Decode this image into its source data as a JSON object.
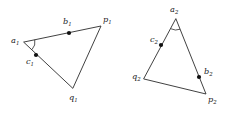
{
  "figure": {
    "type": "geometry-diagram",
    "background_color": "#ffffff",
    "stroke_color": "#2b2b2b",
    "dot_color": "#111111",
    "label_color": "#1a1a1a",
    "width": 230,
    "height": 114
  },
  "shapes": [
    {
      "id": "triangle-1",
      "name": "left-triangle",
      "vertices": [
        {
          "key": "a1",
          "base": "a",
          "sub": "1",
          "x": 24,
          "y": 42,
          "label_x": 11,
          "label_y": 43
        },
        {
          "key": "p1",
          "base": "p",
          "sub": "1",
          "x": 101,
          "y": 26,
          "label_x": 103,
          "label_y": 22
        },
        {
          "key": "q1",
          "base": "q",
          "sub": "1",
          "x": 73,
          "y": 88,
          "label_x": 69,
          "label_y": 100
        }
      ],
      "marked_points": [
        {
          "key": "b1",
          "base": "b",
          "sub": "1",
          "x": 69,
          "y": 33,
          "label_x": 63,
          "label_y": 24
        },
        {
          "key": "c1",
          "base": "c",
          "sub": "1",
          "x": 36,
          "y": 55,
          "label_x": 26,
          "label_y": 64
        }
      ],
      "angle_arc": {
        "at": "a1",
        "radius": 11
      }
    },
    {
      "id": "triangle-2",
      "name": "right-triangle",
      "vertices": [
        {
          "key": "a2",
          "base": "a",
          "sub": "2",
          "x": 176,
          "y": 19,
          "label_x": 170,
          "label_y": 12
        },
        {
          "key": "p2",
          "base": "p",
          "sub": "2",
          "x": 206,
          "y": 94,
          "label_x": 208,
          "label_y": 102
        },
        {
          "key": "q2",
          "base": "q",
          "sub": "2",
          "x": 144,
          "y": 79,
          "label_x": 132,
          "label_y": 79
        }
      ],
      "marked_points": [
        {
          "key": "c2",
          "base": "c",
          "sub": "2",
          "x": 161,
          "y": 45,
          "label_x": 150,
          "label_y": 42
        },
        {
          "key": "b2",
          "base": "b",
          "sub": "2",
          "x": 199,
          "y": 77,
          "label_x": 204,
          "label_y": 74
        }
      ],
      "angle_arc": {
        "at": "a2",
        "radius": 11
      }
    }
  ]
}
